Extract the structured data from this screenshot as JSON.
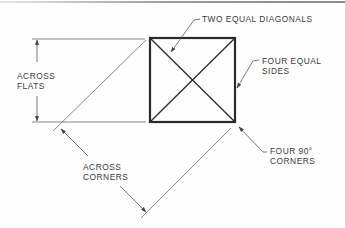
{
  "diagram": {
    "colors": {
      "outline": "#2a2a2a",
      "thin_line": "#6a6a6a",
      "text": "#3a3a3a",
      "top_rule": "#8a8a8a"
    },
    "labels": {
      "two_equal_diagonals": "TWO EQUAL DIAGONALS",
      "four_equal_sides": {
        "line1": "FOUR EQUAL",
        "line2": "SIDES"
      },
      "across_flats": {
        "line1": "ACROSS",
        "line2": "FLATS"
      },
      "four_90_corners": {
        "line1": "FOUR 90°",
        "line2": "CORNERS"
      },
      "across_corners": {
        "line1": "ACROSS",
        "line2": "CORNERS"
      }
    },
    "square": {
      "x": 150,
      "y": 38,
      "size": 85
    }
  }
}
